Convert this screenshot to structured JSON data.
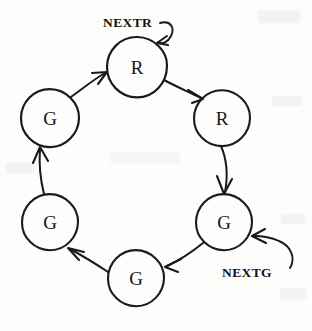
{
  "figure": {
    "kind": "state-transition-cycle-diagram",
    "background_color": "#fdfdfc",
    "ink_color": "#1a1a1d",
    "width": 312,
    "height": 331
  },
  "nodes": [
    {
      "id": "n1",
      "label": "R",
      "cx": 137,
      "cy": 67,
      "r": 30,
      "position": "top"
    },
    {
      "id": "n2",
      "label": "R",
      "cx": 222,
      "cy": 118,
      "r": 28,
      "position": "upper-right"
    },
    {
      "id": "n3",
      "label": "G",
      "cx": 224,
      "cy": 222,
      "r": 28,
      "position": "lower-right"
    },
    {
      "id": "n4",
      "label": "G",
      "cx": 136,
      "cy": 278,
      "r": 28,
      "position": "bottom"
    },
    {
      "id": "n5",
      "label": "G",
      "cx": 50,
      "cy": 222,
      "r": 28,
      "position": "lower-left"
    },
    {
      "id": "n6",
      "label": "G",
      "cx": 50,
      "cy": 118,
      "r": 29,
      "position": "upper-left"
    }
  ],
  "edges": [
    {
      "from": "n1",
      "to": "n2",
      "kind": "cycle"
    },
    {
      "from": "n2",
      "to": "n3",
      "kind": "cycle"
    },
    {
      "from": "n3",
      "to": "n4",
      "kind": "cycle"
    },
    {
      "from": "n4",
      "to": "n5",
      "kind": "cycle"
    },
    {
      "from": "n5",
      "to": "n6",
      "kind": "cycle"
    },
    {
      "from": "n6",
      "to": "n1",
      "kind": "cycle"
    }
  ],
  "input_arrows": [
    {
      "id": "in-nextr",
      "label": "NEXTR",
      "target": "n1",
      "label_x": 103,
      "label_y": 26,
      "description": "curved arrow entering top R node from upper right"
    },
    {
      "id": "in-nextg",
      "label": "NEXTG",
      "target": "n3",
      "label_x": 222,
      "label_y": 276,
      "description": "curved arrow entering lower-right G node from lower right"
    }
  ],
  "node_labels": {
    "n1": "R",
    "n2": "R",
    "n3": "G",
    "n4": "G",
    "n5": "G",
    "n6": "G"
  },
  "labels": {
    "nextr": "NEXTR",
    "nextg": "NEXTG"
  }
}
